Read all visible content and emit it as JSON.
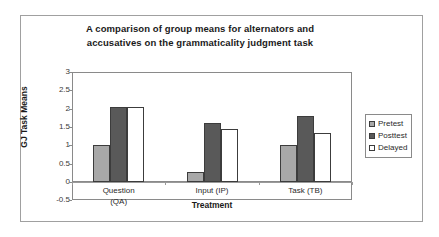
{
  "chart_data": {
    "type": "bar",
    "title": "A comparison of group means for alternators and accusatives on the grammaticality judgment task",
    "title_lines": [
      "A comparison of group means for alternators and",
      "accusatives on the grammaticality judgment task"
    ],
    "xlabel": "Treatment",
    "ylabel": "GJ Task Means",
    "categories": [
      "Question (QA)",
      "Input (IP)",
      "Task (TB)"
    ],
    "category_lines": [
      [
        "Question",
        "(QA)"
      ],
      [
        "Input (IP)"
      ],
      [
        "Task  (TB)"
      ]
    ],
    "series": [
      {
        "name": "Pretest",
        "color": "#a8a8a8",
        "values": [
          1.0,
          0.27,
          1.0
        ]
      },
      {
        "name": "Posttest",
        "color": "#595959",
        "values": [
          2.05,
          1.6,
          1.8
        ]
      },
      {
        "name": "Delayed",
        "color": "#ffffff",
        "values": [
          2.05,
          1.45,
          1.33
        ]
      }
    ],
    "ylim": [
      -0.5,
      3
    ],
    "yticks": [
      "3",
      "2.5",
      "2",
      "1.5",
      "1",
      "0.5",
      "0",
      "-0.5"
    ],
    "ytick_values": [
      3,
      2.5,
      2,
      1.5,
      1,
      0.5,
      0,
      -0.5
    ],
    "grid": false,
    "legend_position": "right",
    "legend_entries": [
      "Pretest",
      "Posttest",
      "Delayed"
    ],
    "bar_border_color": "#3c3c3c",
    "plot_border_color": "#8a8a8a",
    "frame_color": "#a0a0a0"
  }
}
